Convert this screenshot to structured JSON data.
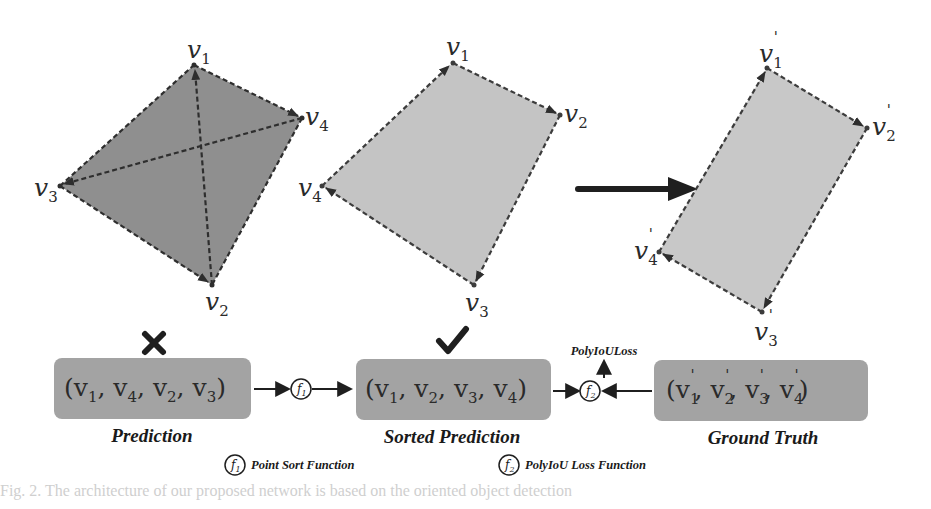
{
  "colors": {
    "prediction_fill": "#8f8f8f",
    "sorted_fill": "#c4c4c4",
    "gt_fill": "#c8c8c8",
    "box_fill": "#a3a3a3",
    "edge": "#3c3c3c",
    "arrow": "#1f1f1f"
  },
  "prediction_polygon": {
    "vertices": [
      {
        "name": "v",
        "sub": "1",
        "prime": false
      },
      {
        "name": "v",
        "sub": "4",
        "prime": false
      },
      {
        "name": "v",
        "sub": "3",
        "prime": false
      },
      {
        "name": "v",
        "sub": "2",
        "prime": false
      }
    ]
  },
  "sorted_polygon": {
    "vertices": [
      {
        "name": "v",
        "sub": "1",
        "prime": false
      },
      {
        "name": "v",
        "sub": "2",
        "prime": false
      },
      {
        "name": "v",
        "sub": "4",
        "prime": false
      },
      {
        "name": "v",
        "sub": "3",
        "prime": false
      }
    ]
  },
  "ground_truth_polygon": {
    "vertices": [
      {
        "name": "v",
        "sub": "1",
        "prime": true
      },
      {
        "name": "v",
        "sub": "2",
        "prime": true
      },
      {
        "name": "v",
        "sub": "4",
        "prime": true
      },
      {
        "name": "v",
        "sub": "3",
        "prime": true
      }
    ]
  },
  "status_marks": {
    "prediction": "cross-icon",
    "sorted": "check-icon"
  },
  "boxes": {
    "prediction": {
      "tuple": [
        "1",
        "4",
        "2",
        "3"
      ],
      "prime": false,
      "caption": "Prediction"
    },
    "sorted": {
      "tuple": [
        "1",
        "2",
        "3",
        "4"
      ],
      "prime": false,
      "caption": "Sorted Prediction"
    },
    "ground_truth": {
      "tuple": [
        "1",
        "2",
        "3",
        "4"
      ],
      "prime": true,
      "caption": "Ground Truth"
    }
  },
  "functions": {
    "f1": {
      "symbol": "f",
      "sub": "1"
    },
    "f2": {
      "symbol": "f",
      "sub": "2"
    },
    "output_label": "PolyIoULoss"
  },
  "legend": [
    {
      "symbol": "f",
      "sub": "1",
      "label": "Point Sort Function"
    },
    {
      "symbol": "f",
      "sub": "2",
      "label": "PolyIoU Loss Function"
    }
  ],
  "footer_text": "Fig. 2. The architecture of our proposed network is based on the oriented object detection"
}
